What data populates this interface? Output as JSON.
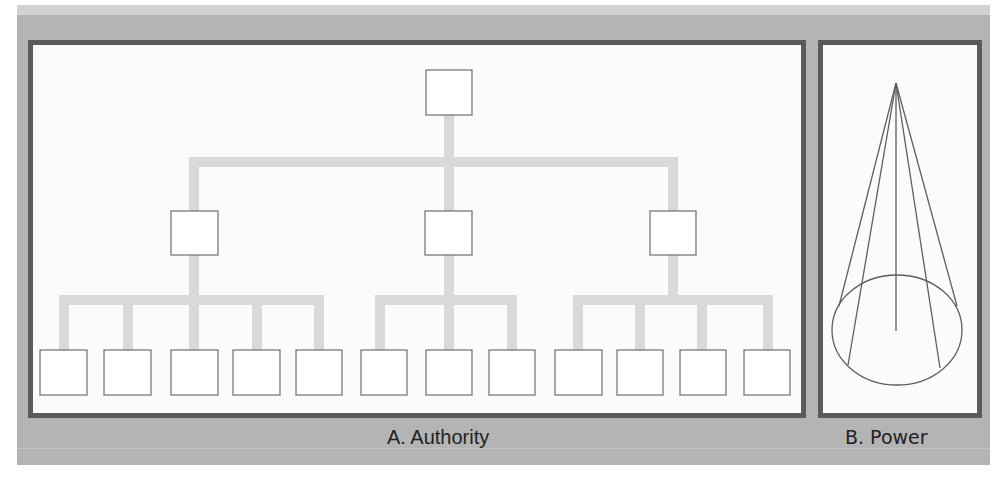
{
  "figure": {
    "panels": [
      {
        "id": "A",
        "label": "A. Authority",
        "diagram": "hierarchical-org-chart",
        "levels": [
          {
            "level": 0,
            "node_count": 1
          },
          {
            "level": 1,
            "node_count": 3
          },
          {
            "level": 2,
            "node_count": 12,
            "children_per_parent": [
              5,
              3,
              4
            ]
          }
        ]
      },
      {
        "id": "B",
        "label": "B. Power",
        "diagram": "cone",
        "radial_lines": 5
      }
    ],
    "colors": {
      "panel_background": "#b4b4b4",
      "panel_border": "#5a5a5a",
      "connector": "#d9d9d9",
      "node_stroke": "#6e6e6e",
      "cone_stroke": "#5e5e5e"
    }
  }
}
